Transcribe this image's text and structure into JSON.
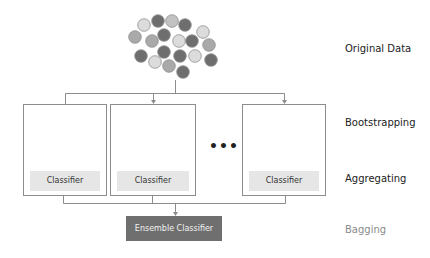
{
  "palette": {
    "dark": "#6e6e6e",
    "mid": "#a9a9a9",
    "midlight": "#c2c2c2",
    "light": "#dcdcdc",
    "stroke": "#8f8f8f",
    "line": "#8c8c8c"
  },
  "original_data": {
    "label": "Original Data",
    "points": [
      "light",
      "dark",
      "midlight",
      "dark",
      "mid",
      "mid",
      "dark",
      "light",
      "dark",
      "light",
      "dark",
      "dark",
      "light",
      "dark",
      "light",
      "mid",
      "dark",
      "mid",
      "dark"
    ]
  },
  "stages": {
    "bootstrapping": "Bootstrapping",
    "aggregating": "Aggregating",
    "bagging": "Bagging"
  },
  "samples": [
    {
      "rows": [
        [
          "midlight",
          "light",
          "midlight",
          "midlight",
          "dark"
        ],
        [
          "light",
          "dark",
          "mid",
          "dark",
          "midlight"
        ]
      ],
      "classifier_label": "Classifier"
    },
    {
      "rows": [
        [
          "midlight",
          "light",
          "light",
          "light",
          "dark"
        ],
        [
          "dark",
          "light",
          "light",
          "dark",
          "dark"
        ]
      ],
      "classifier_label": "Classifier"
    },
    {
      "rows": [
        [
          "dark",
          "light",
          "dark",
          "dark",
          "dark"
        ],
        [
          "dark",
          "dark",
          "light",
          "dark",
          "midlight"
        ]
      ],
      "classifier_label": "Classifier"
    }
  ],
  "ellipsis": "•••",
  "ensemble_label": "Ensemble Classifier"
}
